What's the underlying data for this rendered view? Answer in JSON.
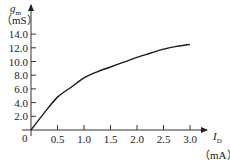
{
  "chart_data": {
    "type": "line",
    "title": "",
    "xlabel": "I_D (mA)",
    "ylabel": "g_m (mS)",
    "x_symbol": "I",
    "x_subscript": "D",
    "x_unit": "（mA）",
    "y_symbol": "g",
    "y_subscript": "m",
    "y_unit": "（mS）",
    "xlim": [
      0,
      3.3
    ],
    "ylim": [
      0,
      15
    ],
    "grid": false,
    "legend": null,
    "x_ticks": [
      0.5,
      1.0,
      1.5,
      2.0,
      2.5,
      3.0
    ],
    "x_tick_labels": [
      "0.5",
      "1.0",
      "1.5",
      "2.0",
      "2.5",
      "3.0"
    ],
    "y_ticks": [
      2.0,
      4.0,
      6.0,
      8.0,
      10.0,
      12.0,
      14.0
    ],
    "y_tick_labels": [
      "2.0",
      "4.0",
      "6.0",
      "8.0",
      "10.0",
      "12.0",
      "14.0"
    ],
    "origin_label": "0",
    "series": [
      {
        "name": "gm vs ID",
        "x": [
          0,
          0.25,
          0.5,
          0.75,
          1.0,
          1.25,
          1.5,
          1.75,
          2.0,
          2.25,
          2.5,
          2.75,
          3.0
        ],
        "values": [
          0,
          2.5,
          4.8,
          6.2,
          7.6,
          8.5,
          9.2,
          9.9,
          10.6,
          11.2,
          11.8,
          12.2,
          12.5
        ]
      }
    ],
    "line_color": "#1a1a1a",
    "axis_color": "#333333"
  }
}
